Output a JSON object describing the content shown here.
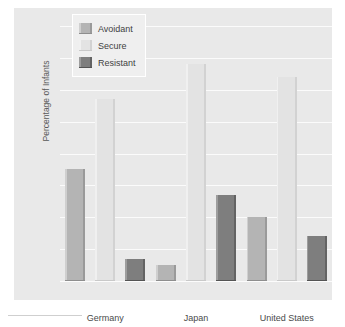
{
  "chart_data": {
    "type": "bar",
    "title": "",
    "xlabel": "",
    "ylabel": "Percentage of Infants",
    "ylim": [
      0,
      80
    ],
    "yticks": [
      0,
      10,
      20,
      30,
      40,
      50,
      60,
      70,
      80
    ],
    "ytick_labels": [
      "0",
      "10",
      "20",
      "30",
      "40",
      "50",
      "60",
      "70",
      "80"
    ],
    "grid": true,
    "legend_position": "upper-left",
    "categories": [
      "Germany",
      "Japan",
      "United States"
    ],
    "series": [
      {
        "name": "Avoidant",
        "color": "#b4b4b4",
        "values": [
          35,
          5,
          20
        ]
      },
      {
        "name": "Secure",
        "color": "#e3e3e3",
        "values": [
          57,
          68,
          64
        ]
      },
      {
        "name": "Resistant",
        "color": "#7e7e7e",
        "values": [
          7,
          27,
          14
        ]
      }
    ]
  },
  "legend": {
    "items": [
      {
        "label": "Avoidant",
        "swatch": "legend-swatch-avoidant"
      },
      {
        "label": "Secure",
        "swatch": "legend-swatch-secure"
      },
      {
        "label": "Resistant",
        "swatch": "legend-swatch-resistant"
      }
    ]
  }
}
